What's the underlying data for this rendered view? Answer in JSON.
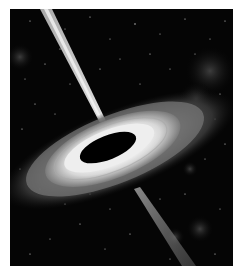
{
  "image": {
    "alt": "Black hole with accretion disk and relativistic jets against a starfield",
    "palette": {
      "background": "#ffffff",
      "space": "#050505",
      "disk_bright": "#f2f2f2",
      "disk_mid": "#9a9a9a",
      "disk_outer": "#5a5a5a",
      "hole": "#000000",
      "jet": "#cfcfcf"
    }
  }
}
